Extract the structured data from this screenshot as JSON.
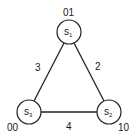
{
  "diagram": {
    "type": "graph",
    "nodes": [
      {
        "id": "s1",
        "label": "s",
        "subscript": "1",
        "code": "01"
      },
      {
        "id": "s2",
        "label": "s",
        "subscript": "2",
        "code": "10"
      },
      {
        "id": "s3",
        "label": "s",
        "subscript": "3",
        "code": "00"
      }
    ],
    "edges": [
      {
        "from": "s1",
        "to": "s3",
        "weight": "3"
      },
      {
        "from": "s1",
        "to": "s2",
        "weight": "2"
      },
      {
        "from": "s3",
        "to": "s2",
        "weight": "4"
      }
    ]
  }
}
